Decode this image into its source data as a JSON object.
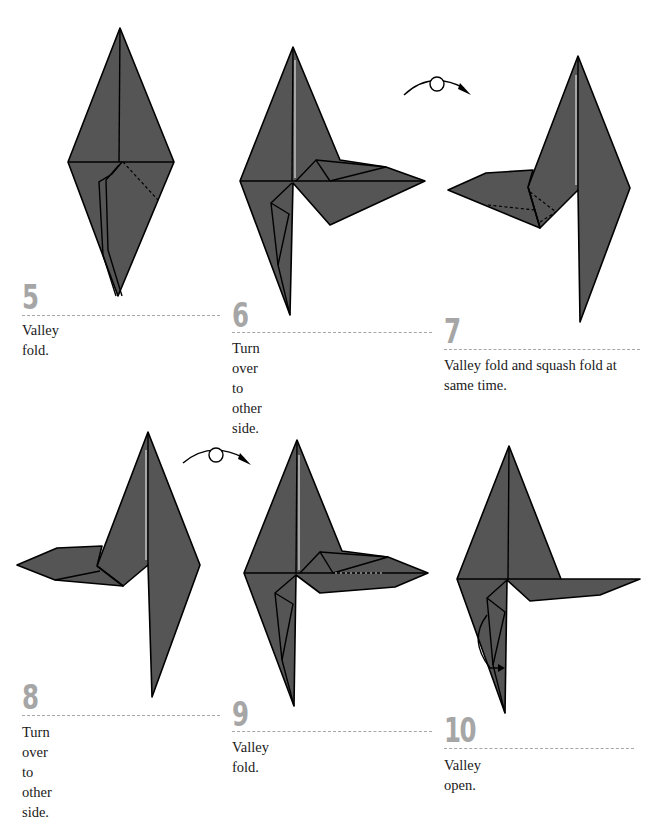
{
  "diagram": {
    "type": "origami-instructions",
    "colors": {
      "paper": "#555555",
      "outline": "#000000",
      "step_number": "#a6a6a6",
      "rule": "#a6a6a6",
      "caption": "#1a1a1a"
    },
    "steps": [
      {
        "number": "5",
        "caption": "Valley fold."
      },
      {
        "number": "6",
        "caption": "Turn over to other side."
      },
      {
        "number": "7",
        "caption": "Valley fold and squash fold at same time."
      },
      {
        "number": "8",
        "caption": "Turn over to other side."
      },
      {
        "number": "9",
        "caption": "Valley fold."
      },
      {
        "number": "10",
        "caption": "Valley open."
      }
    ],
    "symbols": [
      {
        "name": "turn-over-icon",
        "between_steps": [
          "6",
          "7"
        ]
      },
      {
        "name": "turn-over-icon",
        "between_steps": [
          "8",
          "9"
        ]
      }
    ]
  }
}
